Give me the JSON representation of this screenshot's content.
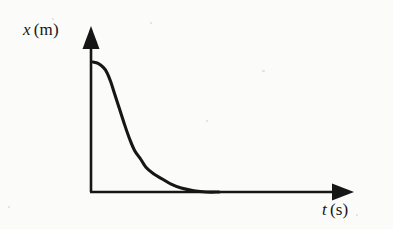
{
  "figure": {
    "background_color": "#fbfbfa",
    "ink_color": "#161616",
    "y_axis": {
      "symbol": "x",
      "unit": "(m)",
      "label": "x (m)"
    },
    "x_axis": {
      "symbol": "t",
      "unit": "(s)",
      "label": "t (s)"
    }
  },
  "chart_data": {
    "type": "line",
    "title": "",
    "xlabel": "t (s)",
    "ylabel": "x (m)",
    "xlim": [
      0,
      1
    ],
    "ylim": [
      0,
      1
    ],
    "grid": false,
    "legend": "none",
    "axis_style": "arrow-tipped",
    "tick_labels": {
      "x": [],
      "y": []
    },
    "annotations": [],
    "series": [
      {
        "name": "displacement",
        "description": "Displacement decays from an initial maximum, flat at first, then steeply, approaching zero asymptotically.",
        "x": [
          0.0,
          0.04,
          0.08,
          0.11,
          0.14,
          0.17,
          0.21,
          0.25,
          0.29,
          0.33,
          0.38,
          0.42,
          0.48,
          0.55,
          0.62,
          0.7,
          0.8,
          0.9,
          1.0
        ],
        "y": [
          1.0,
          0.99,
          0.96,
          0.92,
          0.85,
          0.76,
          0.64,
          0.52,
          0.41,
          0.32,
          0.25,
          0.19,
          0.14,
          0.1,
          0.06,
          0.03,
          0.01,
          0.0,
          0.0
        ]
      }
    ]
  }
}
